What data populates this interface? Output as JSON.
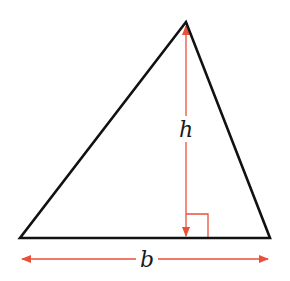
{
  "diagram": {
    "labels": {
      "height": "h",
      "base": "b"
    },
    "colors": {
      "outline": "#111111",
      "measure": "#e8503a",
      "background": "#ffffff"
    },
    "triangle": {
      "apex": [
        186,
        22
      ],
      "base_left": [
        20,
        238
      ],
      "base_right": [
        270,
        238
      ]
    },
    "height_line": {
      "x": 186,
      "y_top": 22,
      "y_bottom": 238
    },
    "right_angle_box": {
      "x": 186,
      "y": 214,
      "size": 23
    },
    "base_arrow": {
      "y": 259,
      "x_left": 20,
      "x_right": 270
    }
  }
}
